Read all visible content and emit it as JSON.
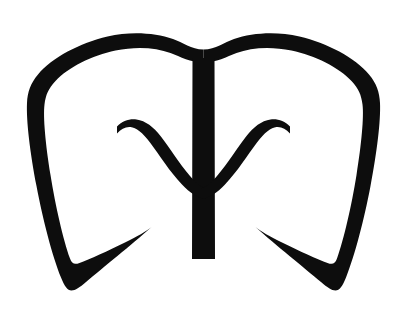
{
  "document": {
    "title": "Logo Mark",
    "background_color": "#ffffff",
    "width": 405,
    "height": 319
  },
  "artwork": {
    "name": "stylized-shield-trident-mark",
    "description": "Black brush-stroke logo: an open shield or tooth-like outline formed by two thick curved strokes meeting in a V-notch at the top center, each sweeping down and hooking inward to a tapered point at the bottom; a vertical stem descends from the notch and two inner curved strokes branch upward and outward from it, each ending in a tapered hook.",
    "ink_color": "#0d0d0d",
    "paper_color": "#ffffff",
    "stroke_style": "tapered brush",
    "symmetry": "bilateral-vertical",
    "center_axis_x": 203,
    "elements": [
      {
        "name": "left-outer-stroke",
        "label": "Left outer shield stroke",
        "top_y": 34,
        "bottom_y": 290,
        "leftmost_x": 26,
        "stroke_width": 21
      },
      {
        "name": "right-outer-stroke",
        "label": "Right outer shield stroke",
        "top_y": 34,
        "bottom_y": 290,
        "rightmost_x": 378,
        "stroke_width": 21
      },
      {
        "name": "center-notch",
        "label": "Top center V notch",
        "apex_x": 204,
        "apex_y": 57
      },
      {
        "name": "center-stem",
        "label": "Vertical center stem",
        "top_y": 62,
        "bottom_y": 259,
        "width": 22
      },
      {
        "name": "left-inner-branch",
        "label": "Left inner branch stroke",
        "tip_x": 120,
        "tip_y": 127,
        "join_y": 185
      },
      {
        "name": "right-inner-branch",
        "label": "Right inner branch stroke",
        "tip_x": 288,
        "tip_y": 127,
        "join_y": 185
      },
      {
        "name": "left-bottom-hook",
        "label": "Left bottom hook point",
        "tip_x": 150,
        "tip_y": 227
      },
      {
        "name": "right-bottom-hook",
        "label": "Right bottom hook point",
        "tip_x": 256,
        "tip_y": 227
      }
    ]
  }
}
